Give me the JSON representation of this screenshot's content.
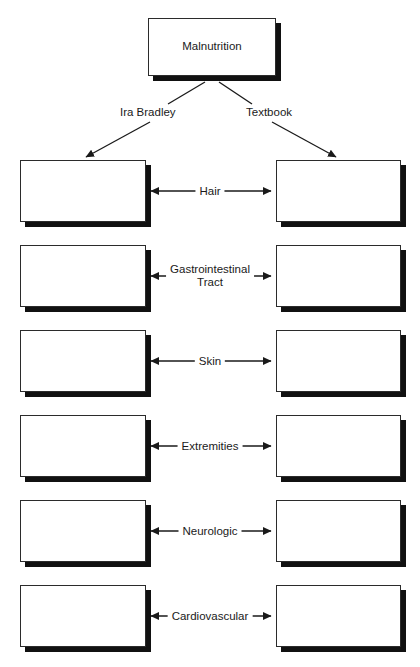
{
  "diagram": {
    "title_box": {
      "label": "Malnutrition"
    },
    "branches": [
      {
        "name": "branch-ira-bradley",
        "label": "Ira Bradley",
        "side": "left"
      },
      {
        "name": "branch-textbook",
        "label": "Textbook",
        "side": "right"
      }
    ],
    "rows": [
      {
        "label": "Hair",
        "left_value": "",
        "right_value": "",
        "top": 160
      },
      {
        "label": "Gastrointestinal\nTract",
        "left_value": "",
        "right_value": "",
        "top": 245
      },
      {
        "label": "Skin",
        "left_value": "",
        "right_value": "",
        "top": 330
      },
      {
        "label": "Extremities",
        "left_value": "",
        "right_value": "",
        "top": 415
      },
      {
        "label": "Neurologic",
        "left_value": "",
        "right_value": "",
        "top": 500
      },
      {
        "label": "Cardiovascular",
        "left_value": "",
        "right_value": "",
        "top": 585
      }
    ],
    "colors": {
      "background": "#ffffff",
      "box_fill": "#ffffff",
      "box_border": "#2b2b2b",
      "shadow": "#111111",
      "text": "#1a1a1a",
      "connector": "#1a1a1a"
    }
  }
}
